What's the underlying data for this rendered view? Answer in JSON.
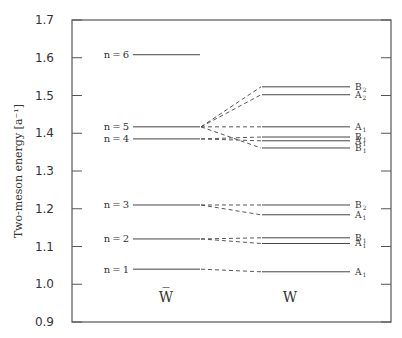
{
  "chart_data": {
    "type": "energy-level-diagram",
    "title": "",
    "ylabel": "Two-meson energy [a⁻¹]",
    "ylim": [
      0.9,
      1.7
    ],
    "yticks": [
      "0.9",
      "1.0",
      "1.1",
      "1.2",
      "1.3",
      "1.4",
      "1.5",
      "1.6",
      "1.7"
    ],
    "grid": false,
    "columns": [
      {
        "label": "W̅",
        "name": "W-bar"
      },
      {
        "label": "W",
        "name": "W"
      }
    ],
    "wbar_levels": [
      {
        "label": "n=1",
        "energy": 1.04
      },
      {
        "label": "n=2",
        "energy": 1.12
      },
      {
        "label": "n=3",
        "energy": 1.21
      },
      {
        "label": "n=4",
        "energy": 1.385
      },
      {
        "label": "n=5",
        "energy": 1.417
      },
      {
        "label": "n=6",
        "energy": 1.608
      }
    ],
    "w_levels": [
      {
        "symbol": "A",
        "sub": "1",
        "energy": 1.033,
        "from": "n=1"
      },
      {
        "symbol": "A",
        "sub": "1",
        "energy": 1.108,
        "from": "n=2"
      },
      {
        "symbol": "B",
        "sub": "1",
        "energy": 1.123,
        "from": "n=2"
      },
      {
        "symbol": "A",
        "sub": "1",
        "energy": 1.184,
        "from": "n=3"
      },
      {
        "symbol": "B",
        "sub": "2",
        "energy": 1.21,
        "from": "n=3"
      },
      {
        "symbol": "B",
        "sub": "1",
        "energy": 1.361,
        "from": "n=5"
      },
      {
        "symbol": "A",
        "sub": "1",
        "energy": 1.38,
        "from": "n=4"
      },
      {
        "symbol": "B",
        "sub": "1",
        "energy": 1.39,
        "from": "n=4"
      },
      {
        "symbol": "A",
        "sub": "1",
        "energy": 1.417,
        "from": "n=5"
      },
      {
        "symbol": "A",
        "sub": "2",
        "energy": 1.502,
        "from": "n=5"
      },
      {
        "symbol": "B",
        "sub": "2",
        "energy": 1.523,
        "from": "n=5"
      }
    ]
  },
  "colors": {
    "line": "#444444",
    "frame": "#555555",
    "text": "#333333"
  }
}
